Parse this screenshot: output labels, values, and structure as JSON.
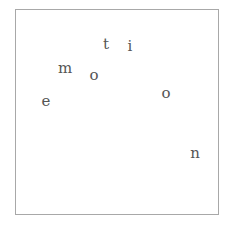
{
  "word": "emotion",
  "letters": [
    {
      "char": "e",
      "x": 46,
      "y": 101
    },
    {
      "char": "m",
      "x": 65,
      "y": 68
    },
    {
      "char": "o",
      "x": 94,
      "y": 75
    },
    {
      "char": "t",
      "x": 106,
      "y": 44
    },
    {
      "char": "i",
      "x": 130,
      "y": 46
    },
    {
      "char": "o",
      "x": 166,
      "y": 93
    },
    {
      "char": "n",
      "x": 195,
      "y": 153
    }
  ],
  "colors": {
    "text": "#555555",
    "border": "#a8a8a8",
    "background": "#ffffff"
  }
}
